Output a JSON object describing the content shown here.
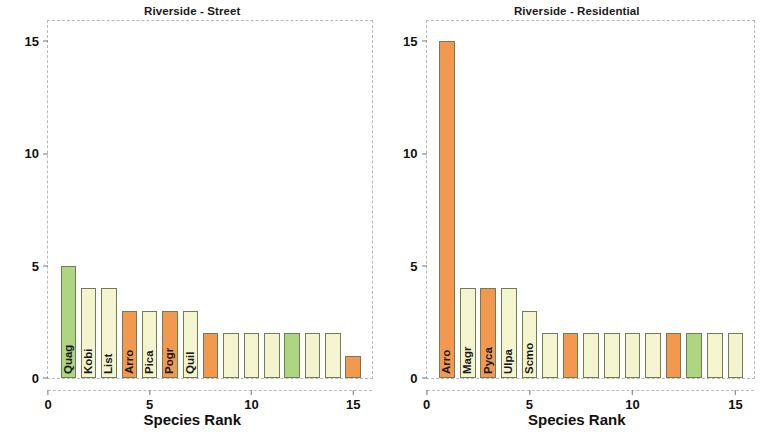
{
  "figure": {
    "background": "#ffffff",
    "panel_count": 2
  },
  "palette": {
    "green": "#aed581",
    "cream": "#f4f4ce",
    "orange": "#f2994f",
    "bar_edge": "#6f7d50",
    "axis": "#777777",
    "text": "#111111"
  },
  "chart_data": [
    {
      "type": "bar",
      "title": "Riverside - Street",
      "xlabel": "Species Rank",
      "ylabel": "Species Abundance",
      "xlim": [
        0,
        15.9
      ],
      "ylim": [
        0,
        15.9
      ],
      "xticks": [
        0,
        5,
        10,
        15
      ],
      "xtick_labels": [
        "0",
        "5",
        "10",
        "15"
      ],
      "yticks": [
        0,
        5,
        10,
        15
      ],
      "ytick_labels": [
        "0",
        "5",
        "10",
        "15"
      ],
      "grid": false,
      "legend": "none",
      "categories": [
        1,
        2,
        3,
        4,
        5,
        6,
        7,
        8,
        9,
        10,
        11,
        12,
        13,
        14,
        15
      ],
      "values": [
        5,
        4,
        4,
        3,
        3,
        3,
        3,
        2,
        2,
        2,
        2,
        2,
        2,
        2,
        1
      ],
      "colors": [
        "green",
        "cream",
        "cream",
        "orange",
        "cream",
        "orange",
        "cream",
        "orange",
        "cream",
        "cream",
        "cream",
        "green",
        "cream",
        "cream",
        "orange"
      ],
      "bar_labels": [
        "Quag",
        "Kobi",
        "List",
        "Arro",
        "Pica",
        "Pogr",
        "Quil",
        "",
        "",
        "",
        "",
        "",
        "",
        "",
        ""
      ]
    },
    {
      "type": "bar",
      "title": "Riverside - Residential",
      "xlabel": "Species Rank",
      "ylabel": "",
      "xlim": [
        0,
        15.9
      ],
      "ylim": [
        0,
        15.9
      ],
      "xticks": [
        0,
        5,
        10,
        15
      ],
      "xtick_labels": [
        "0",
        "5",
        "10",
        "15"
      ],
      "yticks": [
        0,
        5,
        10,
        15
      ],
      "ytick_labels": [
        "0",
        "5",
        "10",
        "15"
      ],
      "grid": false,
      "legend": "none",
      "categories": [
        1,
        2,
        3,
        4,
        5,
        6,
        7,
        8,
        9,
        10,
        11,
        12,
        13,
        14,
        15
      ],
      "values": [
        15,
        4,
        4,
        4,
        3,
        2,
        2,
        2,
        2,
        2,
        2,
        2,
        2,
        2,
        2
      ],
      "colors": [
        "orange",
        "cream",
        "orange",
        "cream",
        "cream",
        "cream",
        "orange",
        "cream",
        "cream",
        "cream",
        "cream",
        "orange",
        "green",
        "cream",
        "cream"
      ],
      "bar_labels": [
        "Arro",
        "Magr",
        "Pyca",
        "Ulpa",
        "Scmo",
        "",
        "",
        "",
        "",
        "",
        "",
        "",
        "",
        "",
        ""
      ]
    }
  ]
}
